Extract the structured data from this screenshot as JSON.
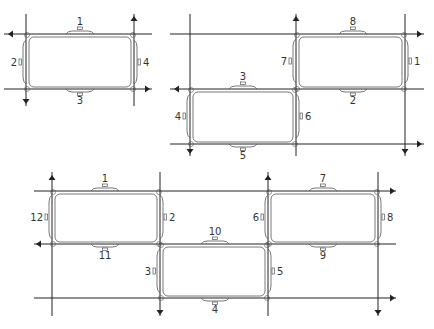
{
  "diagram": {
    "type": "traffic-loop-layout",
    "figures": [
      {
        "id": "fig-a",
        "description": "Single block bounded by two horizontal and two vertical roads",
        "h_lines": [
          34,
          89
        ],
        "v_lines": [
          26,
          134
        ],
        "x_range": [
          4,
          152
        ],
        "y_range": [
          14,
          106
        ],
        "arrows": [
          {
            "x": 8,
            "y": 34,
            "dir": "left"
          },
          {
            "x": 134,
            "y": 16,
            "dir": "up"
          },
          {
            "x": 26,
            "y": 104,
            "dir": "down"
          },
          {
            "x": 150,
            "y": 89,
            "dir": "right"
          }
        ],
        "loops": [
          {
            "x1": 27,
            "y1": 35,
            "x2": 133,
            "y2": 89
          }
        ],
        "sensors": [
          {
            "label": "1",
            "side": "top",
            "x": 80,
            "y": 34
          },
          {
            "label": "2",
            "side": "left",
            "x": 26,
            "y": 62
          },
          {
            "label": "3",
            "side": "bottom",
            "x": 80,
            "y": 89
          },
          {
            "label": "4",
            "side": "right",
            "x": 134,
            "y": 62
          }
        ]
      },
      {
        "id": "fig-b",
        "description": "Two diagonally offset blocks on a 3x3 road grid",
        "h_lines": [
          34,
          89,
          144
        ],
        "v_lines": [
          190,
          296,
          405
        ],
        "x_range": [
          170,
          424
        ],
        "y_range": [
          14,
          156
        ],
        "arrows": [
          {
            "x": 296,
            "y": 16,
            "dir": "up"
          },
          {
            "x": 422,
            "y": 34,
            "dir": "right"
          },
          {
            "x": 174,
            "y": 89,
            "dir": "left"
          },
          {
            "x": 190,
            "y": 154,
            "dir": "down"
          },
          {
            "x": 405,
            "y": 154,
            "dir": "down"
          },
          {
            "x": 422,
            "y": 144,
            "dir": "right"
          }
        ],
        "loops": [
          {
            "x1": 297,
            "y1": 35,
            "x2": 404,
            "y2": 89
          },
          {
            "x1": 191,
            "y1": 90,
            "x2": 295,
            "y2": 144
          }
        ],
        "sensors": [
          {
            "label": "8",
            "side": "top",
            "x": 353,
            "y": 34
          },
          {
            "label": "7",
            "side": "left",
            "x": 296,
            "y": 61
          },
          {
            "label": "1",
            "side": "right",
            "x": 405,
            "y": 61
          },
          {
            "label": "2",
            "side": "bottom",
            "x": 353,
            "y": 89
          },
          {
            "label": "3",
            "side": "top",
            "x": 243,
            "y": 89
          },
          {
            "label": "4",
            "side": "left",
            "x": 190,
            "y": 116
          },
          {
            "label": "6",
            "side": "right",
            "x": 296,
            "y": 116
          },
          {
            "label": "5",
            "side": "bottom",
            "x": 243,
            "y": 144
          }
        ]
      },
      {
        "id": "fig-c",
        "description": "Three blocks in a staggered arrangement on a 3x4 road grid",
        "h_lines": [
          191,
          244,
          298
        ],
        "v_lines": [
          52,
          160,
          268,
          378
        ],
        "x_range": [
          34,
          396
        ],
        "y_range": [
          172,
          316
        ],
        "arrows": [
          {
            "x": 52,
            "y": 175,
            "dir": "up"
          },
          {
            "x": 268,
            "y": 175,
            "dir": "up"
          },
          {
            "x": 395,
            "y": 191,
            "dir": "right"
          },
          {
            "x": 36,
            "y": 244,
            "dir": "left"
          },
          {
            "x": 160,
            "y": 315,
            "dir": "down"
          },
          {
            "x": 378,
            "y": 315,
            "dir": "down"
          },
          {
            "x": 395,
            "y": 298,
            "dir": "right"
          }
        ],
        "loops": [
          {
            "x1": 53,
            "y1": 192,
            "x2": 159,
            "y2": 244
          },
          {
            "x1": 269,
            "y1": 192,
            "x2": 377,
            "y2": 244
          },
          {
            "x1": 161,
            "y1": 245,
            "x2": 267,
            "y2": 298
          }
        ],
        "sensors": [
          {
            "label": "1",
            "side": "top",
            "x": 105,
            "y": 191
          },
          {
            "label": "12",
            "side": "left",
            "x": 52,
            "y": 217
          },
          {
            "label": "2",
            "side": "right",
            "x": 160,
            "y": 217
          },
          {
            "label": "11",
            "side": "bottom",
            "x": 105,
            "y": 244
          },
          {
            "label": "7",
            "side": "top",
            "x": 323,
            "y": 191
          },
          {
            "label": "6",
            "side": "left",
            "x": 268,
            "y": 217
          },
          {
            "label": "8",
            "side": "right",
            "x": 378,
            "y": 217
          },
          {
            "label": "9",
            "side": "bottom",
            "x": 323,
            "y": 244
          },
          {
            "label": "10",
            "side": "top",
            "x": 215,
            "y": 244
          },
          {
            "label": "3",
            "side": "left",
            "x": 160,
            "y": 271
          },
          {
            "label": "5",
            "side": "right",
            "x": 268,
            "y": 271
          },
          {
            "label": "4",
            "side": "bottom",
            "x": 215,
            "y": 298
          }
        ]
      }
    ],
    "colors": {
      "line": "#222222",
      "loop": "#555555",
      "label": "#333333",
      "background": "#ffffff"
    }
  }
}
